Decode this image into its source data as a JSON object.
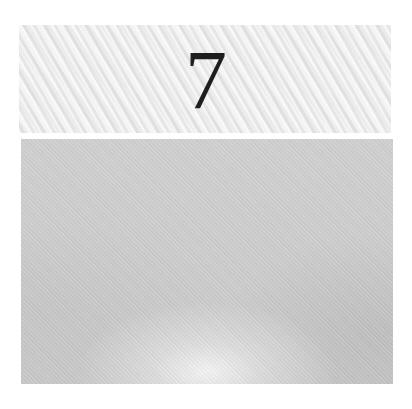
{
  "chapter": {
    "number": "7"
  },
  "colors": {
    "header_panel": "#ececec",
    "numeral": "#1e1e1e",
    "image_panel": "#cccccc",
    "page_background": "#ffffff"
  }
}
